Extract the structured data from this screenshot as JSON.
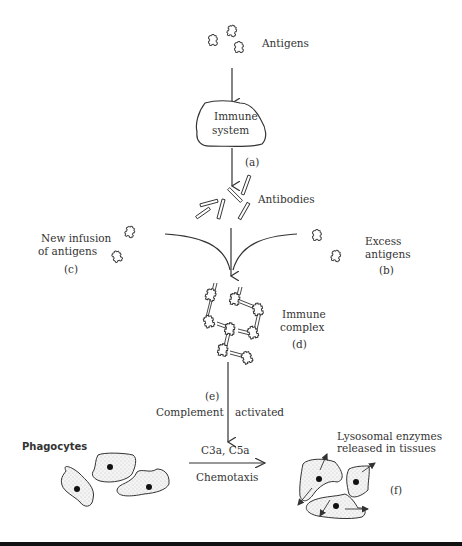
{
  "diagram": {
    "labels": {
      "antigens": "Antigens",
      "immune_system_1": "Immune",
      "immune_system_2": "system",
      "step_a": "(a)",
      "antibodies": "Antibodies",
      "new_infusion_1": "New infusion",
      "new_infusion_2": "of antigens",
      "step_c": "(c)",
      "excess_1": "Excess",
      "excess_2": "antigens",
      "step_b": "(b)",
      "immune_complex_1": "Immune",
      "immune_complex_2": "complex",
      "step_d": "(d)",
      "step_e": "(e)",
      "complement": "Complement",
      "activated": "activated",
      "phagocytes": "Phagocytes",
      "c3a_c5a": "C3a, C5a",
      "chemotaxis": "Chemotaxis",
      "lysosomal_1": "Lysosomal enzymes",
      "lysosomal_2": "released in tissues",
      "step_f": "(f)"
    },
    "nodes": [
      "Antigens",
      "Immune system",
      "Antibodies",
      "New infusion of antigens",
      "Excess antigens",
      "Immune complex",
      "Complement activated",
      "Phagocytes",
      "Lysosomal enzymes released in tissues"
    ],
    "edges": [
      {
        "from": "Antigens",
        "to": "Immune system"
      },
      {
        "from": "Immune system",
        "to": "Antibodies",
        "label": "(a)"
      },
      {
        "from": "Antibodies",
        "to": "Immune complex"
      },
      {
        "from": "New infusion of antigens",
        "to": "Immune complex",
        "label": "(c)"
      },
      {
        "from": "Excess antigens",
        "to": "Immune complex",
        "label": "(b)"
      },
      {
        "from": "Immune complex",
        "to": "Complement activated",
        "label": "(e)"
      },
      {
        "from": "Phagocytes",
        "to": "Lysosomal enzymes released in tissues",
        "label": "C3a, C5a / Chemotaxis"
      }
    ]
  }
}
